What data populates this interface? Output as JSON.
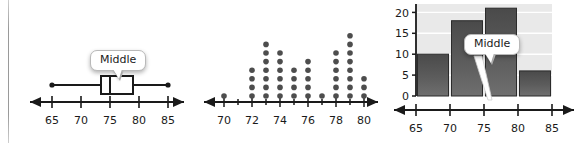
{
  "figure": {
    "panels": [
      "boxplot",
      "dotplot",
      "histogram"
    ]
  },
  "callouts": {
    "boxplot": "Middle",
    "dotplot": "Middle",
    "histogram": "Middle?"
  },
  "colors": {
    "axis": "#1a1a1a",
    "dot": "#4d4d4d",
    "bar_top": "#4a4a4a",
    "bar_bottom": "#6e6e6e",
    "plot_background": "#e9e9e9",
    "gridline": "#ffffff",
    "divider": "#9a9a9a",
    "callout_fill": "#ffffff",
    "callout_border": "#b9b9b9"
  },
  "chart_data": [
    {
      "type": "boxplot",
      "title": "",
      "xlabel": "",
      "ylabel": "",
      "xlim": [
        62,
        88
      ],
      "ticks": [
        65,
        70,
        75,
        80,
        85
      ],
      "tick_labels": [
        "65",
        "70",
        "75",
        "80",
        "85"
      ],
      "grid": false,
      "annotation": "Middle",
      "annotation_target": 75,
      "box": {
        "min": 65,
        "q1": 73.5,
        "median": 75,
        "q3": 79,
        "max": 85
      }
    },
    {
      "type": "dotplot",
      "title": "",
      "xlabel": "",
      "ylabel": "",
      "xlim": [
        68.6,
        81.4
      ],
      "ticks": [
        70,
        71,
        72,
        73,
        74,
        75,
        76,
        77,
        78,
        79,
        80
      ],
      "tick_labels": [
        "70",
        "",
        "72",
        "",
        "74",
        "",
        "76",
        "",
        "78",
        "",
        "80"
      ],
      "grid": false,
      "annotation": "Middle",
      "annotation_target": 75.5,
      "categories": [
        70,
        71,
        72,
        73,
        74,
        75,
        76,
        77,
        78,
        79,
        80
      ],
      "values": [
        1,
        0,
        4,
        7,
        6,
        4,
        5,
        1,
        6,
        8,
        3
      ]
    },
    {
      "type": "bar",
      "subtype": "histogram",
      "title": "",
      "xlabel": "",
      "ylabel": "",
      "xlim": [
        63,
        87
      ],
      "ylim": [
        0,
        22
      ],
      "ticks": [
        65,
        70,
        75,
        80,
        85
      ],
      "tick_labels": [
        "65",
        "70",
        "75",
        "80",
        "85"
      ],
      "yticks": [
        0,
        5,
        10,
        15,
        20
      ],
      "ytick_labels": [
        "0",
        "5",
        "10",
        "15",
        "20"
      ],
      "grid": true,
      "annotation": "Middle?",
      "annotation_target": 73,
      "bin_edges": [
        65,
        70,
        75,
        80,
        85
      ],
      "categories": [
        "65-70",
        "70-75",
        "75-80",
        "80-85"
      ],
      "values": [
        10,
        18,
        21,
        6
      ]
    }
  ]
}
